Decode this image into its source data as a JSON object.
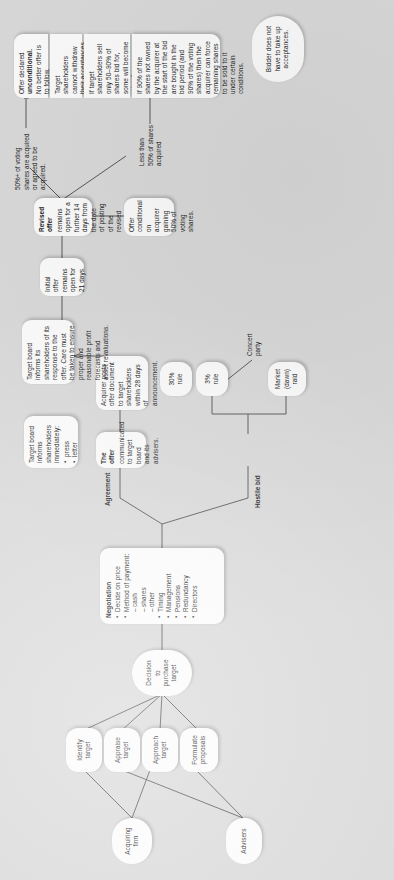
{
  "diagram": {
    "background_color": "#d9d9d9",
    "node_fill": "#fbfbfb",
    "line_color": "#4a4a4a",
    "orientation": "text rotated 90 degrees (portrait page, landscape diagram)"
  },
  "nodes": {
    "acquiring_firm": "Acquiring\nfirm",
    "advisers": "Advisers",
    "identify_target": "Identify\ntarget",
    "appraise_target": "Appraise\ntarget",
    "approach_target": "Approach\ntarget",
    "formulate_proposals": "Formulate\nproposals",
    "decision_to_purchase": "Decision\nto\npurchase\ntarget",
    "negotiation": {
      "header": "Negotiation",
      "items": [
        {
          "kind": "bullet",
          "text": "Decide on price"
        },
        {
          "kind": "bullet",
          "text": "Method of payment:"
        },
        {
          "kind": "dash",
          "text": "cash"
        },
        {
          "kind": "dash",
          "text": "shares"
        },
        {
          "kind": "dash",
          "text": "other"
        },
        {
          "kind": "bullet",
          "text": "Timing"
        },
        {
          "kind": "bullet",
          "text": "Management"
        },
        {
          "kind": "bullet",
          "text": "Pensions"
        },
        {
          "kind": "bullet",
          "text": "Redundancy"
        },
        {
          "kind": "bullet",
          "text": "Directors"
        }
      ]
    },
    "the_offer": {
      "header": "The offer",
      "body": "communicated to target board and its advisers."
    },
    "target_board_informs": {
      "lead": "Target board informs shareholders immediately:",
      "items": [
        {
          "kind": "bullet",
          "text": "press"
        },
        {
          "kind": "bullet",
          "text": "letter"
        }
      ]
    },
    "acquirer_posts": "Acquirer posts offer document to target shareholders within 28 days of announcement.",
    "target_board_response": "Target board informs its shareholders of its response to the offer. Care must be taken to ensure proper and reasonable profit forecasts and asset revaluations.",
    "initial_offer": "Initial offer remains open for 21 days.",
    "revised_offer": {
      "header": "Revised offer",
      "body": "remains open for a further 14 days from the date of posting of the revised offer."
    },
    "offer_conditional": "Offer conditional on acquirer gaining 50% of voting shares.",
    "offer_unconditional": {
      "lead": "Offer declared",
      "bold": "unconditional.",
      "tail": "No better offer is to follow."
    },
    "cannot_withdraw": "Target shareholders cannot withdraw their acceptances.",
    "minority_shareholders": "If target shareholders sell only 50–90% of shares bid for, some will become minority shareholders in target",
    "ninety_percent": "If 90% of the shares not owned by the acquirer at the start of the bid are bought in the bid period (and 90% of the voting shares) then the acquirer can force remaining shares to be sold to it under certain conditions.",
    "bidder_no_acceptances": "Bidder does not have to take up acceptances.",
    "three_percent_rule": "3%\nrule",
    "thirty_percent_rule": "30%\nrule",
    "market_raid": "Market\n(dawn) raid"
  },
  "edge_labels": {
    "agreement": "Agreement",
    "hostile_bid": "Hostile bid",
    "concert_party": "Concert\nparty",
    "fifty_percent_plus": "50%+ of voting shares are acquired or agreed to be acquired.",
    "less_than_fifty": "Less than 50% of shares acquired"
  }
}
